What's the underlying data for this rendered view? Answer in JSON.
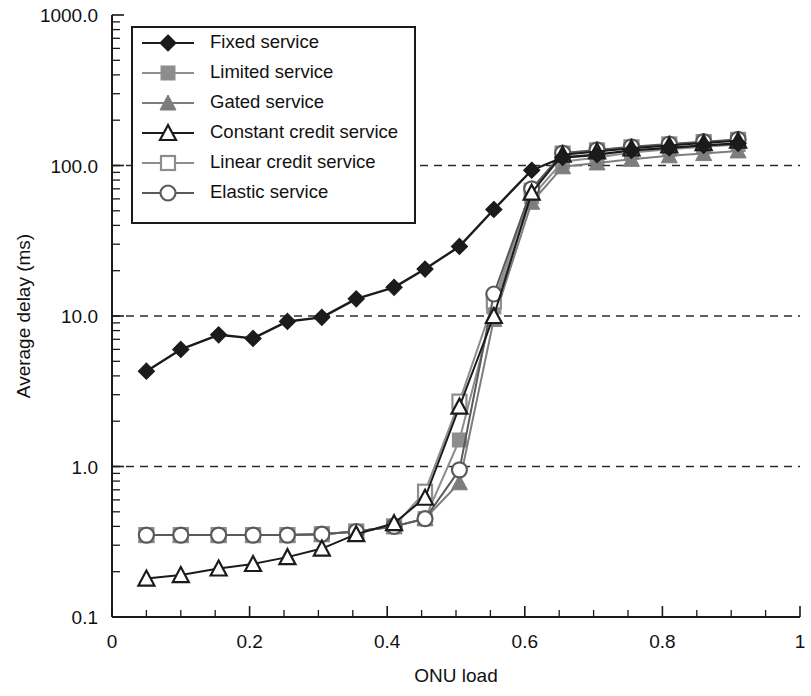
{
  "chart_data": {
    "type": "line",
    "title": "",
    "xlabel": "ONU load",
    "ylabel": "Average delay (ms)",
    "xlim": [
      0,
      1
    ],
    "ylim": [
      0.1,
      1000.0
    ],
    "yscale": "log",
    "xscale": "linear",
    "grid": "horizontal dashed at 1.0, 10.0, 100.0",
    "legend_position": "upper left inside",
    "xticks": [
      "0",
      "0.2",
      "0.4",
      "0.6",
      "0.8",
      "1"
    ],
    "xtick_values": [
      0,
      0.2,
      0.4,
      0.6,
      0.8,
      1
    ],
    "xminor_step": 0.05,
    "yticks": [
      "0.1",
      "1.0",
      "10.0",
      "100.0",
      "1000.0"
    ],
    "ytick_values": [
      0.1,
      1,
      10,
      100,
      1000
    ],
    "series": [
      {
        "name": "Fixed service",
        "marker": "filled-diamond",
        "color": "#1b1b1b",
        "x": [
          0.05,
          0.1,
          0.155,
          0.205,
          0.255,
          0.305,
          0.355,
          0.41,
          0.455,
          0.505,
          0.555,
          0.61,
          0.655,
          0.705,
          0.755,
          0.81,
          0.86,
          0.91
        ],
        "y": [
          4.3,
          6.0,
          7.5,
          7.1,
          9.2,
          9.8,
          13.0,
          15.5,
          20.5,
          29.0,
          51.0,
          93.0,
          113.0,
          118.0,
          126.0,
          131.0,
          136.0,
          140.0
        ]
      },
      {
        "name": "Limited service",
        "marker": "filled-square",
        "color": "#8d8d8d",
        "x": [
          0.05,
          0.1,
          0.155,
          0.205,
          0.255,
          0.305,
          0.355,
          0.41,
          0.455,
          0.505,
          0.555,
          0.61,
          0.655,
          0.705,
          0.755,
          0.81,
          0.86,
          0.91
        ],
        "y": [
          0.35,
          0.35,
          0.35,
          0.35,
          0.35,
          0.355,
          0.37,
          0.4,
          0.45,
          1.5,
          11.5,
          62.0,
          106.0,
          113.0,
          122.0,
          128.0,
          133.0,
          138.0
        ]
      },
      {
        "name": "Gated service",
        "marker": "filled-triangle",
        "color": "#7d7d7d",
        "x": [
          0.05,
          0.1,
          0.155,
          0.205,
          0.255,
          0.305,
          0.355,
          0.41,
          0.455,
          0.505,
          0.555,
          0.61,
          0.655,
          0.705,
          0.755,
          0.81,
          0.86,
          0.91
        ],
        "y": [
          0.35,
          0.35,
          0.35,
          0.35,
          0.35,
          0.355,
          0.37,
          0.4,
          0.45,
          0.78,
          9.5,
          57.0,
          98.0,
          104.0,
          110.0,
          116.0,
          120.0,
          125.0
        ]
      },
      {
        "name": "Constant credit service",
        "marker": "open-triangle",
        "color": "#1b1b1b",
        "x": [
          0.05,
          0.1,
          0.155,
          0.205,
          0.255,
          0.305,
          0.355,
          0.41,
          0.455,
          0.505,
          0.555,
          0.61,
          0.655,
          0.705,
          0.755,
          0.81,
          0.86,
          0.91
        ],
        "y": [
          0.18,
          0.19,
          0.21,
          0.225,
          0.25,
          0.285,
          0.355,
          0.42,
          0.62,
          2.5,
          10.0,
          66.0,
          118.0,
          124.0,
          130.0,
          136.0,
          141.0,
          146.0
        ]
      },
      {
        "name": "Linear credit service",
        "marker": "open-square",
        "color": "#8d8d8d",
        "x": [
          0.05,
          0.1,
          0.155,
          0.205,
          0.255,
          0.305,
          0.355,
          0.41,
          0.455,
          0.505,
          0.555,
          0.61,
          0.655,
          0.705,
          0.755,
          0.81,
          0.86,
          0.91
        ],
        "y": [
          0.35,
          0.35,
          0.35,
          0.35,
          0.35,
          0.355,
          0.37,
          0.4,
          0.68,
          2.7,
          12.5,
          68.0,
          120.0,
          126.0,
          132.0,
          138.0,
          143.0,
          148.0
        ]
      },
      {
        "name": "Elastic service",
        "marker": "open-circle",
        "color": "#5a5a5a",
        "x": [
          0.05,
          0.1,
          0.155,
          0.205,
          0.255,
          0.305,
          0.355,
          0.41,
          0.455,
          0.505,
          0.555,
          0.61,
          0.655,
          0.705,
          0.755,
          0.81,
          0.86,
          0.91
        ],
        "y": [
          0.35,
          0.35,
          0.35,
          0.35,
          0.35,
          0.355,
          0.37,
          0.4,
          0.45,
          0.95,
          14.0,
          70.0,
          121.0,
          127.0,
          133.0,
          139.0,
          144.0,
          149.0
        ]
      }
    ]
  },
  "legend": {
    "items": [
      {
        "label": "Fixed service"
      },
      {
        "label": "Limited service"
      },
      {
        "label": "Gated service"
      },
      {
        "label": "Constant credit service"
      },
      {
        "label": "Linear credit service"
      },
      {
        "label": "Elastic service"
      }
    ]
  },
  "axes": {
    "y_title": "Average delay (ms)",
    "x_title": "ONU load"
  }
}
